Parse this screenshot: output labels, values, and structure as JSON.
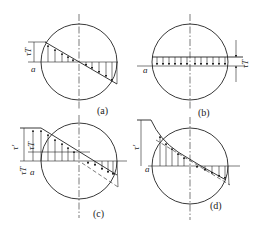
{
  "figure": {
    "panels": [
      {
        "id": "a",
        "caption": "(a)",
        "symbols": [
          "τT",
          "a"
        ],
        "distribution": "linear antisymmetric"
      },
      {
        "id": "b",
        "caption": "(b)",
        "symbols": [
          "τT",
          "a"
        ],
        "distribution": "uniform"
      },
      {
        "id": "c",
        "caption": "(c)",
        "symbols": [
          "τ'",
          "τT",
          "τT",
          "a"
        ],
        "distribution": "linear with plateau"
      },
      {
        "id": "d",
        "caption": "(d)",
        "symbols": [
          "τ'",
          "a"
        ],
        "distribution": "curved with plateau"
      }
    ],
    "labels": {
      "a_caption": "(a)",
      "b_caption": "(b)",
      "c_caption": "(c)",
      "d_caption": "(d)",
      "tau_T": "τT",
      "tau_prime": "τ'",
      "a_point": "a"
    },
    "line_color": "#222222",
    "background": "#ffffff"
  }
}
